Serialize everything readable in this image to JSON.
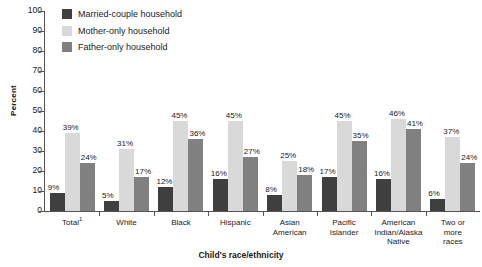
{
  "chart_data": {
    "type": "bar",
    "title": "",
    "xlabel": "Child's race/ethnicity",
    "ylabel": "Percent",
    "ylim": [
      0,
      100
    ],
    "ytick_step": 10,
    "yticks": [
      100,
      90,
      80,
      70,
      60,
      50,
      40,
      30,
      20,
      10,
      0
    ],
    "grid": false,
    "legend_position": "top-left",
    "value_suffix": "%",
    "categories": [
      "Total¹",
      "White",
      "Black",
      "Hispanic",
      "Asian American",
      "Pacific Islander",
      "American Indian/Alaska Native",
      "Two or more races"
    ],
    "category_lines": [
      [
        "Total¹"
      ],
      [
        "White"
      ],
      [
        "Black"
      ],
      [
        "Hispanic"
      ],
      [
        "Asian",
        "American"
      ],
      [
        "Pacific",
        "Islander"
      ],
      [
        "American",
        "Indian/Alaska",
        "Native"
      ],
      [
        "Two or",
        "more",
        "races"
      ]
    ],
    "series": [
      {
        "name": "Married-couple household",
        "color": "#3f3f3f",
        "values": [
          9,
          5,
          12,
          16,
          8,
          17,
          16,
          6
        ],
        "labels": [
          "9%",
          "5%",
          "12%",
          "16%",
          "8%",
          "17%",
          "16%",
          "6%"
        ]
      },
      {
        "name": "Mother-only household",
        "color": "#d9d9d9",
        "values": [
          39,
          31,
          45,
          45,
          25,
          45,
          46,
          37
        ],
        "labels": [
          "39%",
          "31%",
          "45%",
          "45%",
          "25%",
          "45%",
          "46%",
          "37%"
        ]
      },
      {
        "name": "Father-only household",
        "color": "#808080",
        "values": [
          24,
          17,
          36,
          27,
          18,
          35,
          41,
          24
        ],
        "labels": [
          "24%",
          "17%",
          "36%",
          "27%",
          "18%",
          "35%",
          "41%",
          "24%"
        ]
      }
    ]
  },
  "legend": {
    "items": [
      {
        "label": "Married-couple household",
        "color": "#3f3f3f"
      },
      {
        "label": "Mother-only household",
        "color": "#d9d9d9"
      },
      {
        "label": "Father-only household",
        "color": "#808080"
      }
    ]
  },
  "axes": {
    "y_title": "Percent",
    "x_title": "Child's race/ethnicity"
  }
}
